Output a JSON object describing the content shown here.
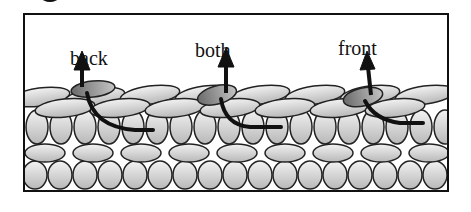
{
  "diagram": {
    "labels": [
      {
        "text": "back",
        "x": 68,
        "y": 46
      },
      {
        "text": "both",
        "x": 193,
        "y": 38
      },
      {
        "text": "front",
        "x": 336,
        "y": 37
      }
    ],
    "colors": {
      "line": "#111111",
      "yarn_light": "#d6d6d6",
      "yarn_dark": "#8a8a8a",
      "background": "#ffffff"
    }
  }
}
